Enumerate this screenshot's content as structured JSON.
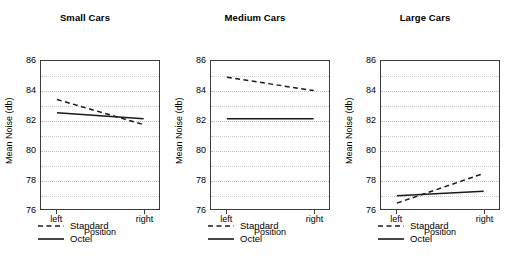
{
  "figure": {
    "background": "#ffffff",
    "line_color": "#1a1a1a",
    "grid_color": "#c8c8c8",
    "axis_color": "#3c3c3c"
  },
  "chart_data": {
    "type": "line",
    "title": "",
    "xlabel": "Position",
    "ylabel": "Mean Noise (db)",
    "categories": [
      "left",
      "right"
    ],
    "ylim": [
      76,
      86
    ],
    "yticks": [
      76,
      78,
      80,
      82,
      84,
      86
    ],
    "ytick_labels": [
      "76",
      "78",
      "80",
      "82",
      "84",
      "86"
    ],
    "minor_gridlines": [
      77,
      79,
      81,
      83,
      85
    ],
    "grid": true,
    "legend_position": "below",
    "legend_entries": [
      "Standard",
      "Octel"
    ],
    "panels": [
      {
        "title": "Small Cars",
        "series": [
          {
            "name": "Standard",
            "style": "dashed",
            "values": [
              83.4,
              81.7
            ]
          },
          {
            "name": "Octel",
            "style": "solid",
            "values": [
              82.5,
              82.1
            ]
          }
        ]
      },
      {
        "title": "Medium Cars",
        "series": [
          {
            "name": "Standard",
            "style": "dashed",
            "values": [
              84.9,
              84.0
            ]
          },
          {
            "name": "Octel",
            "style": "solid",
            "values": [
              82.1,
              82.1
            ]
          }
        ]
      },
      {
        "title": "Large Cars",
        "series": [
          {
            "name": "Standard",
            "style": "dashed",
            "values": [
              76.4,
              78.4
            ]
          },
          {
            "name": "Octel",
            "style": "solid",
            "values": [
              76.9,
              77.2
            ]
          }
        ]
      }
    ]
  }
}
